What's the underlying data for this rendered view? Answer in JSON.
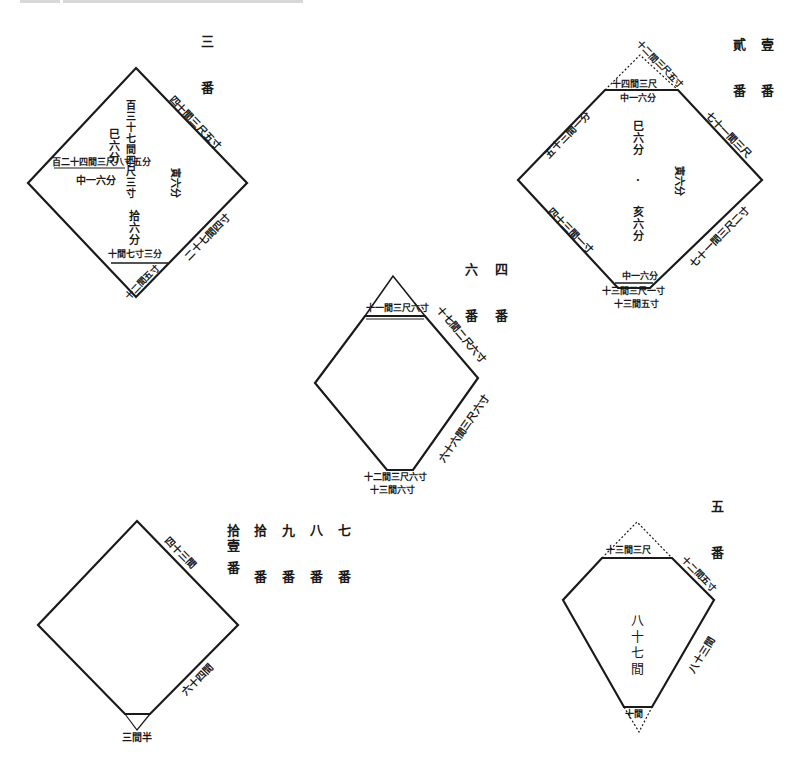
{
  "page": {
    "kind": "Land survey plot diagrams (rhombus / kite-shaped parcels) with Japanese annotations"
  },
  "plot_labels": {
    "plot_3": "三 番",
    "plot_1_2_a": "壹 番",
    "plot_1_2_b": "貳 番",
    "plot_4": "四 番",
    "plot_6": "六 番",
    "plot_5": "五 番",
    "plot_7": "七 番",
    "plot_8": "八 番",
    "plot_9": "九 番",
    "plot_10": "拾 番",
    "plot_11": "拾壹 番"
  },
  "plots": {
    "plot_3": {
      "edge_upper_right": "四十間三尺五寸",
      "edge_lower_right": "二十七間四寸",
      "edge_bottom_cut": "十間七寸三分",
      "edge_bottom_lower": "十二間五寸",
      "inner_vertical": "百三十七間四尺三寸",
      "inner_left_horizontal": "百二十四間三尺八寸五分",
      "inner_values": [
        "巳六分",
        "中一六分",
        "寅六分",
        "拾六分"
      ]
    },
    "plot_1_2": {
      "edge_top_outer": "十二間三尺五寸",
      "edge_top_cut": "十四間三尺",
      "edge_top_cut_below": "中一六分",
      "edge_upper_left": "五十三間一分",
      "edge_upper_right": "七十一間三尺",
      "edge_lower_left": "四十三間一寸",
      "edge_lower_right": "七十一間三尺二寸",
      "edge_bottom_cut_above": "中一六分",
      "edge_bottom_cut": "十三間三尺一寸",
      "edge_bottom_lower": "十三間五寸",
      "inner_values": [
        "巳六分",
        "寅六分",
        "亥六分"
      ]
    },
    "plot_4_6": {
      "edge_top_cut": "十一間三尺六寸",
      "edge_upper_right": "十七間二尺六寸",
      "edge_lower_right": "六十六間三尺六寸",
      "edge_bottom_cut": "十二間三尺六寸",
      "edge_bottom_lower": "十三間六寸"
    },
    "plot_7_11": {
      "edge_upper_right": "四十三間",
      "edge_lower_right": "六十四間",
      "edge_bottom": "三間半"
    },
    "plot_5": {
      "edge_top_cut": "十三間三尺",
      "edge_upper_right": "十二間五寸",
      "edge_lower_right": "八十三間",
      "edge_bottom_cut": "十間",
      "inner_vertical": "八十七間"
    }
  },
  "colors": {
    "ink": "#1a1a1a",
    "paper": "#ffffff",
    "header_fade": "#d8d8d8"
  }
}
